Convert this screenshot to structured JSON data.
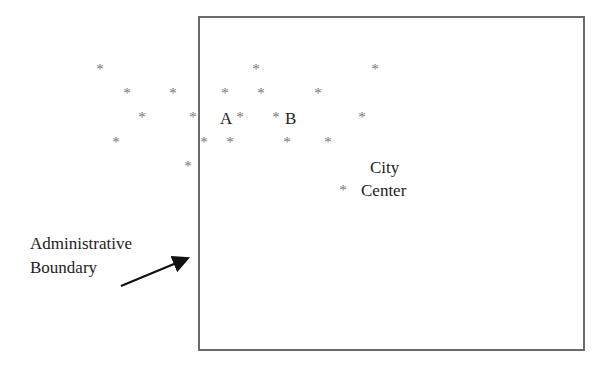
{
  "diagram": {
    "boundary_label_line1": "Administrative",
    "boundary_label_line2": "Boundary",
    "city_label_line1": "City",
    "city_label_line2": "Center",
    "point_a_label": "A",
    "point_b_label": "B",
    "marker_glyph": "*",
    "colors": {
      "boundary": "#6a6a6a",
      "marker": "#777777",
      "text": "#222222",
      "arrow": "#111111"
    },
    "markers": [
      {
        "x": 100,
        "y": 67
      },
      {
        "x": 256,
        "y": 67
      },
      {
        "x": 375,
        "y": 67
      },
      {
        "x": 127,
        "y": 91
      },
      {
        "x": 173,
        "y": 91
      },
      {
        "x": 225,
        "y": 91
      },
      {
        "x": 261,
        "y": 91
      },
      {
        "x": 318,
        "y": 91
      },
      {
        "x": 142,
        "y": 115
      },
      {
        "x": 193,
        "y": 115
      },
      {
        "x": 240,
        "y": 115
      },
      {
        "x": 276,
        "y": 115
      },
      {
        "x": 362,
        "y": 115
      },
      {
        "x": 116,
        "y": 140
      },
      {
        "x": 204,
        "y": 140
      },
      {
        "x": 230,
        "y": 140
      },
      {
        "x": 287,
        "y": 140
      },
      {
        "x": 328,
        "y": 140
      },
      {
        "x": 188,
        "y": 164
      },
      {
        "x": 343,
        "y": 188
      }
    ]
  }
}
